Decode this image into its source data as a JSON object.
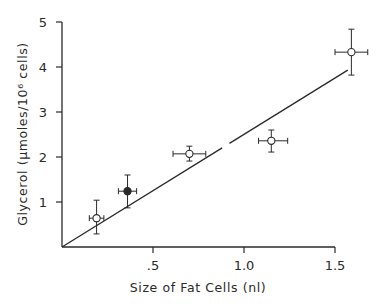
{
  "chart_data": {
    "type": "scatter",
    "title": "",
    "xlabel": "Size of Fat Cells (nl)",
    "ylabel": "Glycerol  (µmoles/10⁶ cells)",
    "xlim": [
      0,
      1.65
    ],
    "ylim": [
      0,
      5
    ],
    "x_ticks": [
      {
        "value": 0.5,
        "label": ".5"
      },
      {
        "value": 1.0,
        "label": "1.0"
      },
      {
        "value": 1.5,
        "label": "1.5"
      }
    ],
    "y_ticks": [
      {
        "value": 1,
        "label": "1"
      },
      {
        "value": 2,
        "label": "2"
      },
      {
        "value": 3,
        "label": "3"
      },
      {
        "value": 4,
        "label": "4"
      },
      {
        "value": 5,
        "label": "5"
      }
    ],
    "grid": false,
    "legend": null,
    "points": [
      {
        "x": 0.19,
        "y": 0.64,
        "x_err": [
          0.15,
          0.23
        ],
        "y_err": [
          0.29,
          1.04
        ],
        "marker": "open"
      },
      {
        "x": 0.36,
        "y": 1.24,
        "x_err": [
          0.31,
          0.41
        ],
        "y_err": [
          0.87,
          1.6
        ],
        "marker": "filled"
      },
      {
        "x": 0.7,
        "y": 2.07,
        "x_err": [
          0.61,
          0.79
        ],
        "y_err": [
          1.91,
          2.24
        ],
        "marker": "open"
      },
      {
        "x": 1.15,
        "y": 2.36,
        "x_err": [
          1.08,
          1.24
        ],
        "y_err": [
          2.11,
          2.6
        ],
        "marker": "open"
      },
      {
        "x": 1.59,
        "y": 4.33,
        "x_err": [
          1.5,
          1.68
        ],
        "y_err": [
          3.82,
          4.84
        ],
        "marker": "open"
      }
    ],
    "regression_line": {
      "x": [
        0,
        1.57
      ],
      "y": [
        0,
        3.93
      ],
      "gap_x": [
        0.88,
        0.92
      ]
    }
  },
  "colors": {
    "ink": "#2a2a2a",
    "background": "#ffffff"
  }
}
